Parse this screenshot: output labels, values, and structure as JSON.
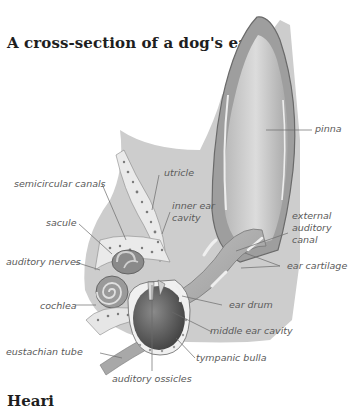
{
  "title": "A cross-section of a dog's ear",
  "footer_heading": "Heari",
  "colors": {
    "background": "#ffffff",
    "title_text": "#1e1e1e",
    "label_text": "#5a5a5a",
    "leader_line": "#6a6a6a",
    "skin": "#c8c8c8",
    "skin_dark": "#9a9a9a",
    "pinna_inner": "#d9d9d9",
    "bone": "#e8e8e8",
    "cavity": "#6e6e6e"
  },
  "labels": {
    "pinna": "pinna",
    "semicircular_canals": "semicircular canals",
    "utricle": "utricle",
    "inner_ear_cavity": "inner ear cavity",
    "sacule": "sacule",
    "external_auditory_canal": "external auditory canal",
    "auditory_nerves": "auditory nerves",
    "ear_cartilage": "ear cartilage",
    "cochlea": "cochlea",
    "ear_drum": "ear drum",
    "middle_ear_cavity": "middle ear cavity",
    "eustachian_tube": "eustachian tube",
    "tympanic_bulla": "tympanic bulla",
    "auditory_ossicles": "auditory ossicles"
  }
}
